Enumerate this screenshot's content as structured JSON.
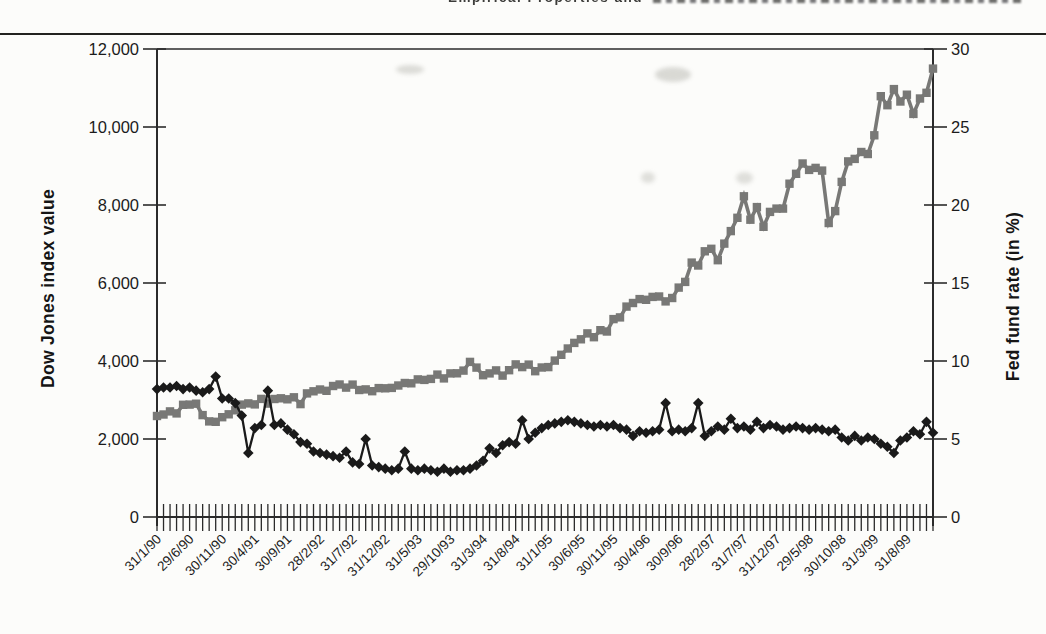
{
  "page": {
    "header_partial_text": "Empirical Properties and"
  },
  "chart_data": {
    "type": "line",
    "title": "",
    "grid": "off",
    "legend": "none",
    "x_axis": {
      "unit": "month-end date, monthly from 31/1/90 to 31/12/99",
      "n_points": 120,
      "label_every_n_ticks": 5,
      "tick_labels": [
        "31/1/90",
        "29/6/90",
        "30/11/90",
        "30/4/91",
        "30/9/91",
        "28/2/92",
        "31/7/92",
        "31/12/92",
        "31/5/93",
        "29/10/93",
        "31/3/94",
        "31/8/94",
        "31/1/95",
        "30/6/95",
        "30/11/95",
        "30/4/96",
        "30/9/96",
        "28/2/97",
        "31/7/97",
        "31/12/97",
        "29/5/98",
        "30/10/98",
        "31/3/99",
        "31/8/99"
      ]
    },
    "y_left": {
      "label": "Dow Jones index value",
      "min": 0,
      "max": 12000,
      "tick_step": 2000,
      "tick_labels": [
        "0",
        "2,000",
        "4,000",
        "6,000",
        "8,000",
        "10,000",
        "12,000"
      ]
    },
    "y_right": {
      "label": "Fed fund rate (in %)",
      "min": 0,
      "max": 30,
      "tick_step": 5,
      "tick_labels": [
        "0",
        "5",
        "10",
        "15",
        "20",
        "25",
        "30"
      ]
    },
    "series": [
      {
        "name": "Dow Jones index value",
        "axis": "left",
        "marker": "square",
        "color": "#787876",
        "values": [
          2590,
          2627,
          2707,
          2657,
          2877,
          2881,
          2905,
          2614,
          2452,
          2442,
          2559,
          2634,
          2736,
          2882,
          2914,
          2888,
          3028,
          2907,
          3025,
          3043,
          3017,
          3069,
          2895,
          3169,
          3223,
          3268,
          3236,
          3359,
          3397,
          3319,
          3394,
          3257,
          3272,
          3226,
          3305,
          3301,
          3310,
          3371,
          3435,
          3428,
          3527,
          3516,
          3540,
          3651,
          3555,
          3681,
          3684,
          3754,
          3978,
          3832,
          3636,
          3682,
          3758,
          3625,
          3765,
          3913,
          3843,
          3908,
          3739,
          3834,
          3844,
          4011,
          4158,
          4321,
          4465,
          4556,
          4708,
          4611,
          4789,
          4756,
          5075,
          5117,
          5395,
          5486,
          5587,
          5569,
          5643,
          5655,
          5529,
          5616,
          5882,
          6029,
          6522,
          6448,
          6813,
          6878,
          6584,
          7009,
          7331,
          7673,
          8223,
          7622,
          7945,
          7442,
          7823,
          7908,
          7907,
          8546,
          8800,
          9063,
          8900,
          8952,
          8883,
          7539,
          7843,
          8592,
          9117,
          9181,
          9359,
          9307,
          9786,
          10789,
          10560,
          10971,
          10655,
          10829,
          10337,
          10730,
          10878,
          11497
        ]
      },
      {
        "name": "Fed fund rate",
        "axis": "right",
        "marker": "diamond",
        "color": "#1a1a1a",
        "values": [
          8.2,
          8.3,
          8.3,
          8.4,
          8.2,
          8.3,
          8.1,
          8.0,
          8.2,
          9.0,
          7.6,
          7.6,
          7.3,
          6.5,
          4.1,
          5.7,
          5.9,
          8.1,
          5.9,
          6.0,
          5.6,
          5.3,
          4.8,
          4.7,
          4.2,
          4.1,
          4.0,
          3.9,
          3.8,
          4.2,
          3.5,
          3.4,
          5.0,
          3.3,
          3.2,
          3.1,
          3.0,
          3.1,
          4.2,
          3.1,
          3.0,
          3.1,
          3.0,
          2.9,
          3.1,
          2.9,
          3.0,
          3.0,
          3.1,
          3.3,
          3.6,
          4.4,
          4.1,
          4.6,
          4.8,
          4.7,
          6.2,
          5.0,
          5.4,
          5.7,
          5.9,
          6.0,
          6.1,
          6.2,
          6.1,
          6.0,
          5.9,
          5.8,
          5.9,
          5.8,
          5.9,
          5.7,
          5.6,
          5.2,
          5.5,
          5.4,
          5.5,
          5.6,
          7.3,
          5.5,
          5.6,
          5.5,
          5.7,
          7.3,
          5.2,
          5.5,
          5.8,
          5.6,
          6.3,
          5.7,
          5.8,
          5.6,
          6.1,
          5.7,
          5.9,
          5.8,
          5.6,
          5.7,
          5.8,
          5.7,
          5.6,
          5.7,
          5.6,
          5.5,
          5.6,
          5.1,
          4.9,
          5.2,
          4.9,
          5.1,
          5.0,
          4.7,
          4.5,
          4.1,
          4.9,
          5.1,
          5.5,
          5.3,
          6.1,
          5.4
        ]
      }
    ]
  }
}
